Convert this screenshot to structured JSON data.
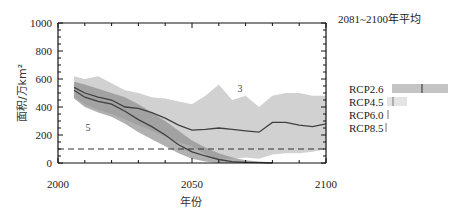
{
  "chart_data": {
    "type": "area",
    "title": "",
    "xlabel": "年份",
    "ylabel": "面积/万km²",
    "xlim": [
      2000,
      2100
    ],
    "ylim": [
      0,
      1000
    ],
    "x_ticks": [
      2000,
      2050,
      2100
    ],
    "y_ticks": [
      0,
      200,
      400,
      600,
      800,
      1000
    ],
    "grid": false,
    "reference_line": {
      "y": 100,
      "style": "dashed"
    },
    "annotations": [
      {
        "text": "3",
        "x": 2068,
        "y": 330
      },
      {
        "text": "5",
        "x": 2011,
        "y": 200
      }
    ],
    "series": [
      {
        "name": "RCP2.6",
        "x": [
          2006,
          2010,
          2015,
          2020,
          2025,
          2030,
          2035,
          2040,
          2045,
          2050,
          2055,
          2060,
          2065,
          2070,
          2075,
          2080,
          2085,
          2090,
          2095,
          2100
        ],
        "mean": [
          540,
          500,
          470,
          450,
          400,
          390,
          360,
          320,
          270,
          235,
          240,
          250,
          240,
          230,
          220,
          290,
          290,
          270,
          260,
          280
        ],
        "upper": [
          620,
          600,
          620,
          570,
          520,
          500,
          470,
          460,
          440,
          420,
          480,
          560,
          450,
          480,
          400,
          480,
          500,
          500,
          480,
          480
        ],
        "lower": [
          470,
          420,
          380,
          350,
          310,
          270,
          230,
          190,
          150,
          120,
          60,
          30,
          30,
          40,
          30,
          60,
          70,
          70,
          80,
          100
        ]
      },
      {
        "name": "RCP8.5",
        "x": [
          2006,
          2010,
          2015,
          2020,
          2025,
          2030,
          2035,
          2040,
          2045,
          2050,
          2055,
          2060,
          2065,
          2070,
          2075,
          2080
        ],
        "mean": [
          520,
          470,
          440,
          420,
          370,
          310,
          260,
          200,
          130,
          80,
          50,
          25,
          10,
          5,
          2,
          0
        ],
        "upper": [
          580,
          560,
          530,
          500,
          470,
          420,
          360,
          300,
          230,
          160,
          110,
          70,
          40,
          20,
          10,
          5
        ],
        "lower": [
          460,
          400,
          360,
          330,
          280,
          220,
          170,
          120,
          70,
          30,
          10,
          0,
          0,
          0,
          0,
          0
        ]
      }
    ],
    "legend": {
      "title": "2081~2100年平均",
      "position": "right",
      "entries": [
        {
          "label": "RCP2.6",
          "range": [
            130,
            450
          ],
          "mean": 275
        },
        {
          "label": "RCP4.5",
          "range": [
            20,
            110
          ],
          "mean": 40
        },
        {
          "label": "RCP6.0",
          "range": [
            0,
            10
          ],
          "mean": 8
        },
        {
          "label": "RCP8.5",
          "range": [
            0,
            3
          ],
          "mean": 1
        }
      ]
    }
  },
  "labels": {
    "x_ticks": [
      "2000",
      "2050",
      "2100"
    ],
    "y_ticks": [
      "0",
      "200",
      "400",
      "600",
      "800",
      "1000"
    ],
    "xlabel": "年份",
    "ylabel": "面积/万km²",
    "legend_title": "2081~2100年平均",
    "legend": [
      "RCP2.6",
      "RCP4.5",
      "RCP6.0",
      "RCP8.5"
    ],
    "annot_3": "3",
    "annot_5": "5"
  },
  "colors": {
    "band_light": "#c9c9c9",
    "band_dark": "#8f8f8f",
    "line": "#404040",
    "axis": "#111111",
    "dashed": "#333333"
  }
}
